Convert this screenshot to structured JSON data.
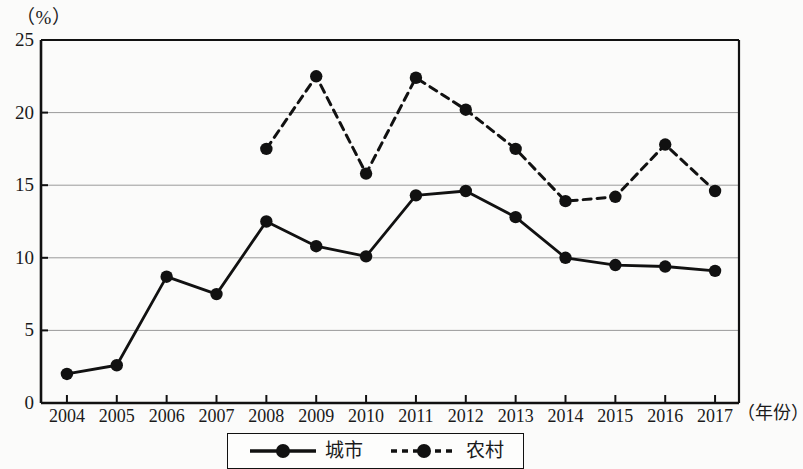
{
  "figure": {
    "y_axis_unit": "（%）",
    "x_axis_title": "（年份）"
  },
  "legend": {
    "items": [
      {
        "label": "城市",
        "style": "solid",
        "marker": "filled-circle",
        "color": "#111111"
      },
      {
        "label": "农村",
        "style": "dashed",
        "marker": "filled-circle",
        "color": "#111111"
      }
    ]
  },
  "chart_data": {
    "type": "line",
    "title": "",
    "xlabel": "（年份）",
    "ylabel": "（%）",
    "categories": [
      "2004",
      "2005",
      "2006",
      "2007",
      "2008",
      "2009",
      "2010",
      "2011",
      "2012",
      "2013",
      "2014",
      "2015",
      "2016",
      "2017"
    ],
    "x_tick_labels": [
      "2004",
      "2005",
      "2006",
      "2007",
      "2008",
      "2009",
      "2010",
      "2011",
      "2012",
      "2013",
      "2014",
      "2015",
      "2016",
      "2017"
    ],
    "y_tick_labels": [
      "0",
      "5",
      "10",
      "15",
      "20",
      "25"
    ],
    "y_ticks": [
      0,
      5,
      10,
      15,
      20,
      25
    ],
    "ylim": [
      0,
      25
    ],
    "grid": "horizontal",
    "legend_position": "bottom-center",
    "series": [
      {
        "name": "城市",
        "style": "solid",
        "values": [
          2.0,
          2.6,
          8.7,
          7.5,
          12.5,
          10.8,
          10.1,
          14.3,
          14.6,
          12.8,
          10.0,
          9.5,
          9.4,
          9.1
        ]
      },
      {
        "name": "农村",
        "style": "dashed",
        "values": [
          null,
          null,
          null,
          null,
          17.5,
          22.5,
          15.8,
          22.4,
          20.2,
          17.5,
          13.9,
          14.2,
          17.8,
          14.6
        ]
      }
    ]
  }
}
